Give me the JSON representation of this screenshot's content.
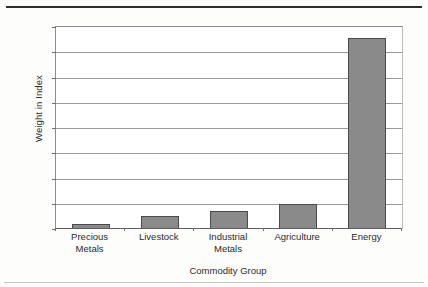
{
  "chart_data": {
    "type": "bar",
    "title": "",
    "xlabel": "Commodity Group",
    "ylabel": "Weight in Index",
    "categories": [
      "Precious Metals",
      "Livestock",
      "Industrial Metals",
      "Agriculture",
      "Energy"
    ],
    "category_lines": [
      [
        "Precious",
        "Metals"
      ],
      [
        "Livestock"
      ],
      [
        "Industrial",
        "Metals"
      ],
      [
        "Agriculture"
      ],
      [
        "Energy"
      ]
    ],
    "values": [
      2,
      5,
      7,
      10,
      75.5
    ],
    "value_labels": [
      "2%",
      "5%",
      "7%",
      "10%",
      "75.5%"
    ],
    "ylim": [
      0,
      80
    ],
    "ytick_values": [
      0,
      10,
      20,
      30,
      40,
      50,
      60,
      70,
      80
    ],
    "ytick_labels": [
      "0%",
      "10%",
      "20%",
      "30%",
      "40%",
      "50%",
      "60%",
      "70%",
      "80%"
    ],
    "grid": true,
    "legend": false,
    "bar_color": "#8a8a8a",
    "bar_border_color": "#4a4a4a",
    "gridline_color": "#9a9a9a",
    "axis_color": "#5e5e5e"
  }
}
